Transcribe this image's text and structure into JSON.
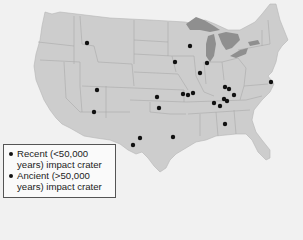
{
  "map": {
    "title": "Impact craters in the contiguous United States",
    "colors": {
      "background": "#f1f1f1",
      "land": "#cdcdcd",
      "state_border": "#a9a9a9",
      "lakes": "#8f8f8f",
      "marker": "#111111"
    },
    "markers": [
      {
        "x": 87,
        "y": 43
      },
      {
        "x": 190,
        "y": 46
      },
      {
        "x": 175,
        "y": 62
      },
      {
        "x": 207,
        "y": 63
      },
      {
        "x": 200,
        "y": 73
      },
      {
        "x": 97,
        "y": 90
      },
      {
        "x": 94,
        "y": 112
      },
      {
        "x": 157,
        "y": 97
      },
      {
        "x": 159,
        "y": 108
      },
      {
        "x": 183,
        "y": 94
      },
      {
        "x": 188,
        "y": 95
      },
      {
        "x": 193,
        "y": 93
      },
      {
        "x": 225,
        "y": 87
      },
      {
        "x": 229,
        "y": 89
      },
      {
        "x": 234,
        "y": 95
      },
      {
        "x": 224,
        "y": 99
      },
      {
        "x": 227,
        "y": 101
      },
      {
        "x": 214,
        "y": 103
      },
      {
        "x": 220,
        "y": 106
      },
      {
        "x": 271,
        "y": 82
      },
      {
        "x": 225,
        "y": 124
      },
      {
        "x": 173,
        "y": 137
      },
      {
        "x": 140,
        "y": 138
      },
      {
        "x": 133,
        "y": 145
      }
    ]
  },
  "legend": {
    "items": [
      {
        "label": "Recent (<50,000 years) impact crater"
      },
      {
        "label": "Ancient (>50,000 years) impact crater"
      }
    ]
  }
}
